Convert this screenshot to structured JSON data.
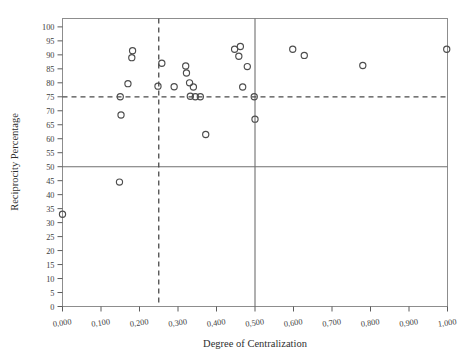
{
  "chart_data": {
    "type": "scatter",
    "title": "",
    "xlabel": "Degree of Centralization",
    "ylabel": "Reciprocity Percentage",
    "xlim": [
      0.0,
      1.0
    ],
    "ylim": [
      0,
      103
    ],
    "grid": false,
    "legend": null,
    "marker": "open-circle",
    "x_tick_labels": [
      "0,000",
      "0,100",
      "0,200",
      "0,300",
      "0,400",
      "0,500",
      "0,600",
      "0,700",
      "0,800",
      "0,900",
      "1,000"
    ],
    "x_tick_values": [
      0.0,
      0.1,
      0.2,
      0.3,
      0.4,
      0.5,
      0.6,
      0.7,
      0.8,
      0.9,
      1.0
    ],
    "y_tick_labels": [
      "0",
      "5",
      "10",
      "15",
      "20",
      "25",
      "30",
      "35",
      "40",
      "45",
      "50",
      "55",
      "60",
      "65",
      "70",
      "75",
      "80",
      "85",
      "90",
      "95",
      "100"
    ],
    "y_tick_values": [
      0,
      5,
      10,
      15,
      20,
      25,
      30,
      35,
      40,
      45,
      50,
      55,
      60,
      65,
      70,
      75,
      80,
      85,
      90,
      95,
      100
    ],
    "reference_lines": [
      {
        "name": "horizontal-solid-50",
        "orientation": "horizontal",
        "value": 50,
        "style": "solid"
      },
      {
        "name": "vertical-solid-0.50",
        "orientation": "vertical",
        "value": 0.5,
        "style": "solid"
      },
      {
        "name": "horizontal-dashed-75",
        "orientation": "horizontal",
        "value": 75,
        "style": "dashed"
      },
      {
        "name": "vertical-dashed-0.25",
        "orientation": "vertical",
        "value": 0.25,
        "style": "dashed"
      }
    ],
    "points": [
      {
        "x": 0.0,
        "y": 33.0
      },
      {
        "x": 0.148,
        "y": 44.5
      },
      {
        "x": 0.15,
        "y": 75.0
      },
      {
        "x": 0.152,
        "y": 68.5
      },
      {
        "x": 0.17,
        "y": 79.7
      },
      {
        "x": 0.182,
        "y": 91.5
      },
      {
        "x": 0.18,
        "y": 89.0
      },
      {
        "x": 0.248,
        "y": 78.8
      },
      {
        "x": 0.258,
        "y": 87.0
      },
      {
        "x": 0.29,
        "y": 78.6
      },
      {
        "x": 0.32,
        "y": 86.0
      },
      {
        "x": 0.322,
        "y": 83.5
      },
      {
        "x": 0.33,
        "y": 80.0
      },
      {
        "x": 0.34,
        "y": 78.5
      },
      {
        "x": 0.332,
        "y": 75.2
      },
      {
        "x": 0.345,
        "y": 75.0
      },
      {
        "x": 0.358,
        "y": 75.0
      },
      {
        "x": 0.372,
        "y": 61.5
      },
      {
        "x": 0.447,
        "y": 92.0
      },
      {
        "x": 0.462,
        "y": 93.0
      },
      {
        "x": 0.458,
        "y": 89.5
      },
      {
        "x": 0.48,
        "y": 85.8
      },
      {
        "x": 0.468,
        "y": 78.5
      },
      {
        "x": 0.498,
        "y": 75.0
      },
      {
        "x": 0.5,
        "y": 67.0
      },
      {
        "x": 0.598,
        "y": 92.0
      },
      {
        "x": 0.628,
        "y": 89.8
      },
      {
        "x": 0.78,
        "y": 86.2
      },
      {
        "x": 0.998,
        "y": 92.0
      }
    ]
  }
}
